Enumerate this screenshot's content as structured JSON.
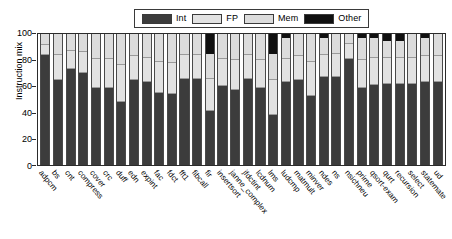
{
  "legend": {
    "entries": [
      {
        "label": "Int",
        "color": "#3c3c3c"
      },
      {
        "label": "FP",
        "color": "#e2e2e2"
      },
      {
        "label": "Mem",
        "color": "#dcdcdc"
      },
      {
        "label": "Other",
        "color": "#101010"
      }
    ]
  },
  "axes": {
    "ylabel": "Instruction mix",
    "yticks": [
      "0",
      "20",
      "40",
      "60",
      "80",
      "100"
    ]
  },
  "chart_data": {
    "type": "bar",
    "subtype": "stacked-bar",
    "title": "",
    "xlabel": "",
    "ylabel": "Instruction mix",
    "ylim": [
      0,
      100
    ],
    "yticks": [
      0,
      20,
      40,
      60,
      80,
      100
    ],
    "grid": false,
    "legend_position": "top-center",
    "stack_order_bottom_to_top": [
      "Int",
      "FP",
      "Mem",
      "Other"
    ],
    "colors": {
      "Int": "#3c3c3c",
      "FP": "#e2e2e2",
      "Mem": "#dcdcdc",
      "Other": "#101010"
    },
    "categories": [
      "adpcm",
      "bs",
      "cnt",
      "compress",
      "cover",
      "crc",
      "duff",
      "edn",
      "expint",
      "fac",
      "fdct",
      "fft1",
      "fibcall",
      "fir",
      "insertsort",
      "janne_complex",
      "jfdctint",
      "lcdnum",
      "lms",
      "ludcmp",
      "matmult",
      "minver",
      "ndes",
      "ns",
      "nsichneu",
      "prime",
      "qsort-exam",
      "qurt",
      "recursion",
      "select",
      "statemate",
      "ud"
    ],
    "series": [
      {
        "name": "Int",
        "values": [
          84,
          65,
          73,
          70,
          59,
          59,
          48,
          65,
          63,
          55,
          54,
          66,
          66,
          41,
          60,
          57,
          66,
          59,
          38,
          63,
          65,
          53,
          67,
          67,
          81,
          59,
          61,
          62,
          62,
          62,
          63,
          63
        ]
      },
      {
        "name": "FP",
        "values": [
          8,
          19,
          14,
          16,
          22,
          22,
          28,
          18,
          19,
          24,
          24,
          18,
          18,
          25,
          21,
          23,
          18,
          21,
          27,
          18,
          18,
          26,
          17,
          18,
          11,
          21,
          21,
          20,
          20,
          20,
          20,
          20
        ]
      },
      {
        "name": "Mem",
        "values": [
          8,
          16,
          13,
          14,
          19,
          19,
          24,
          17,
          18,
          21,
          22,
          16,
          16,
          19,
          19,
          20,
          16,
          20,
          20,
          16,
          17,
          21,
          13,
          15,
          8,
          17,
          15,
          13,
          13,
          18,
          14,
          17
        ]
      },
      {
        "name": "Other",
        "values": [
          0,
          0,
          0,
          0,
          0,
          0,
          0,
          0,
          0,
          0,
          0,
          0,
          0,
          15,
          0,
          0,
          0,
          0,
          15,
          3,
          0,
          0,
          3,
          0,
          0,
          3,
          3,
          5,
          5,
          0,
          3,
          0
        ]
      }
    ]
  }
}
